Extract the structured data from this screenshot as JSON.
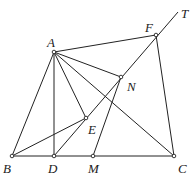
{
  "diagram": {
    "points": [
      {
        "name": "A",
        "x": 54,
        "y": 52,
        "lx": 47,
        "ly": 47
      },
      {
        "name": "B",
        "x": 12,
        "y": 156,
        "lx": 3,
        "ly": 173
      },
      {
        "name": "D",
        "x": 54,
        "y": 156,
        "lx": 48,
        "ly": 173
      },
      {
        "name": "M",
        "x": 93,
        "y": 156,
        "lx": 88,
        "ly": 173
      },
      {
        "name": "C",
        "x": 174,
        "y": 156,
        "lx": 178,
        "ly": 173
      },
      {
        "name": "F",
        "x": 156,
        "y": 35,
        "lx": 145,
        "ly": 32
      },
      {
        "name": "N",
        "x": 121,
        "y": 77,
        "lx": 127,
        "ly": 91
      },
      {
        "name": "E",
        "x": 86,
        "y": 118,
        "lx": 88,
        "ly": 134
      },
      {
        "name": "T",
        "x": 178,
        "y": 12,
        "lx": 181,
        "ly": 18
      }
    ],
    "segments": [
      [
        "A",
        "B"
      ],
      [
        "A",
        "D"
      ],
      [
        "A",
        "E"
      ],
      [
        "A",
        "N"
      ],
      [
        "A",
        "C"
      ],
      [
        "A",
        "F"
      ],
      [
        "B",
        "C"
      ],
      [
        "B",
        "E"
      ],
      [
        "D",
        "T"
      ],
      [
        "M",
        "N"
      ],
      [
        "F",
        "C"
      ]
    ],
    "labeled_points": [
      "A",
      "B",
      "D",
      "M",
      "C",
      "F",
      "N",
      "E",
      "T"
    ],
    "marked_points": [
      "A",
      "B",
      "D",
      "M",
      "C",
      "F",
      "N",
      "E"
    ]
  }
}
